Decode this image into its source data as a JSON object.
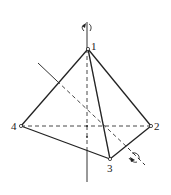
{
  "diagram": {
    "type": "tetrahedron-rotation-axes",
    "vertices": [
      {
        "id": "1",
        "label": "1",
        "x": 88,
        "y": 49
      },
      {
        "id": "2",
        "label": "2",
        "x": 151,
        "y": 126
      },
      {
        "id": "3",
        "label": "3",
        "x": 110,
        "y": 159
      },
      {
        "id": "4",
        "label": "4",
        "x": 21,
        "y": 126
      }
    ],
    "edges_solid": [
      [
        "1",
        "4"
      ],
      [
        "1",
        "2"
      ],
      [
        "1",
        "3"
      ],
      [
        "4",
        "3"
      ],
      [
        "3",
        "2"
      ]
    ],
    "edges_hidden": [
      [
        "4",
        "2"
      ]
    ],
    "axes": [
      {
        "name": "vertical-c3-axis",
        "from": [
          87,
          22
        ],
        "to": [
          87,
          182
        ],
        "rotation_arrow": "top"
      },
      {
        "name": "diagonal-s4-axis",
        "from": [
          38,
          63
        ],
        "to": [
          145,
          165
        ],
        "rotation_arrow": "bottom-right"
      }
    ],
    "colors": {
      "line": "#222222",
      "background": "#ffffff"
    }
  }
}
